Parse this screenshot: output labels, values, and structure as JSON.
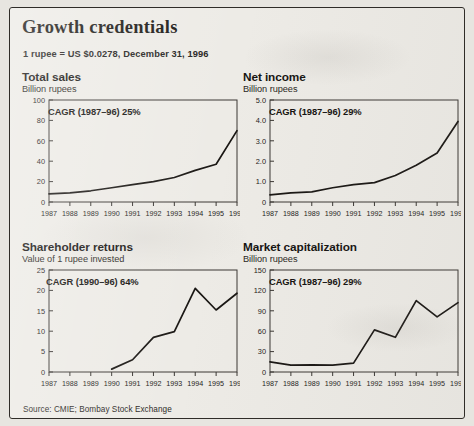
{
  "header": {
    "title": "Growth credentials",
    "subtitle": "1 rupee = US $0.0278, December 31, 1996"
  },
  "footer": {
    "source": "Source: CMIE; Bombay Stock Exchange"
  },
  "chart_data": [
    {
      "type": "line",
      "id": "total-sales",
      "title": "Total sales",
      "subtitle": "Billion rupees",
      "annotation": "CAGR (1987–96) 25%",
      "xlabel": "",
      "ylabel": "Billion rupees",
      "categories": [
        "1987",
        "1988",
        "1989",
        "1990",
        "1991",
        "1992",
        "1993",
        "1994",
        "1995",
        "1996"
      ],
      "values": [
        8,
        9,
        11,
        14,
        17,
        20,
        24,
        31,
        37,
        70
      ],
      "ylim": [
        0,
        100
      ],
      "yticks": [
        0,
        20,
        40,
        60,
        80,
        100
      ],
      "ytick_labels": [
        "0",
        "20",
        "40",
        "60",
        "80",
        "100"
      ],
      "grid": false,
      "legend": "none"
    },
    {
      "type": "line",
      "id": "net-income",
      "title": "Net income",
      "subtitle": "Billion rupees",
      "annotation": "CAGR (1987–96) 29%",
      "xlabel": "",
      "ylabel": "Billion rupees",
      "categories": [
        "1987",
        "1988",
        "1989",
        "1990",
        "1991",
        "1992",
        "1993",
        "1994",
        "1995",
        "1996"
      ],
      "values": [
        0.35,
        0.45,
        0.5,
        0.7,
        0.85,
        0.95,
        1.3,
        1.8,
        2.4,
        3.95
      ],
      "ylim": [
        0,
        5.0
      ],
      "yticks": [
        0,
        1.0,
        2.0,
        3.0,
        4.0,
        5.0
      ],
      "ytick_labels": [
        "0",
        "1.0",
        "2.0",
        "3.0",
        "4.0",
        "5.0"
      ],
      "grid": false,
      "legend": "none"
    },
    {
      "type": "line",
      "id": "shareholder-returns",
      "title": "Shareholder returns",
      "subtitle": "Value of 1 rupee invested",
      "annotation": "CAGR (1990–96) 64%",
      "xlabel": "",
      "ylabel": "Value of 1 rupee invested",
      "categories": [
        "1987",
        "1988",
        "1989",
        "1990",
        "1991",
        "1992",
        "1993",
        "1994",
        "1995",
        "1996"
      ],
      "values": [
        null,
        null,
        null,
        0.7,
        3.0,
        8.5,
        9.9,
        20.5,
        15.2,
        19.3
      ],
      "ylim": [
        0,
        25
      ],
      "yticks": [
        0,
        5,
        10,
        15,
        20,
        25
      ],
      "ytick_labels": [
        "0",
        "5",
        "10",
        "15",
        "20",
        "25"
      ],
      "grid": false,
      "legend": "none"
    },
    {
      "type": "line",
      "id": "market-capitalization",
      "title": "Market capitalization",
      "subtitle": "Billion rupees",
      "annotation": "CAGR (1987–96) 29%",
      "xlabel": "",
      "ylabel": "Billion rupees",
      "categories": [
        "1987",
        "1988",
        "1989",
        "1990",
        "1991",
        "1992",
        "1993",
        "1994",
        "1995",
        "1996"
      ],
      "values": [
        15,
        10,
        10.5,
        10,
        13,
        62,
        51,
        105,
        81,
        102
      ],
      "ylim": [
        0,
        150
      ],
      "yticks": [
        0,
        30,
        60,
        90,
        120,
        150
      ],
      "ytick_labels": [
        "0",
        "30",
        "60",
        "90",
        "120",
        "150"
      ],
      "grid": false,
      "legend": "none"
    }
  ]
}
